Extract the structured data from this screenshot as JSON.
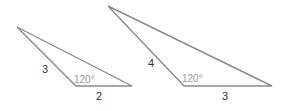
{
  "figures": [
    {
      "id": "triangle-small",
      "vertices": [
        [
          17,
          27
        ],
        [
          76,
          86
        ],
        [
          132,
          86
        ]
      ],
      "side_left": "3",
      "side_bottom": "2",
      "angle": "120°"
    },
    {
      "id": "triangle-large",
      "vertices": [
        [
          108,
          6
        ],
        [
          184,
          86
        ],
        [
          272,
          86
        ]
      ],
      "side_left": "4",
      "side_bottom": "3",
      "angle": "120°"
    }
  ],
  "colors": {
    "edge": "#8a8a8a",
    "label": "#333333",
    "angle": "#9a9a9a"
  }
}
